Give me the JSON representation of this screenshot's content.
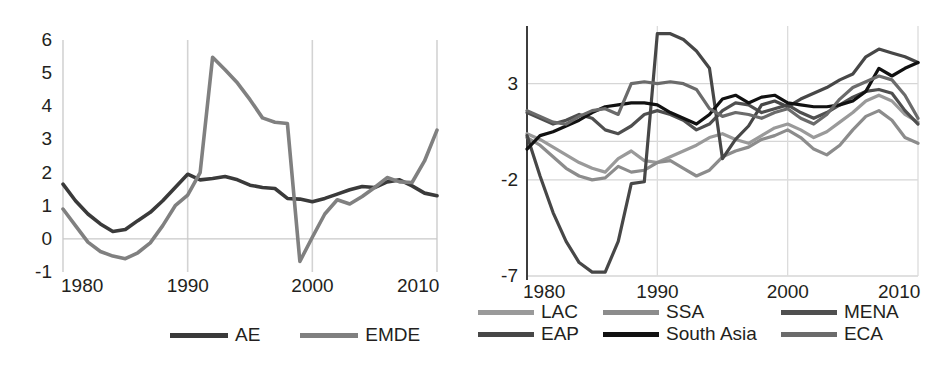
{
  "figure": {
    "background": "#ffffff",
    "text_color": "#231f20"
  },
  "chart_data": [
    {
      "id": "left",
      "type": "line",
      "title": "",
      "xlabel": "",
      "ylabel": "",
      "xlim": [
        1980,
        2010
      ],
      "ylim": [
        -1,
        6
      ],
      "xticks": [
        "1980",
        "1990",
        "2000",
        "2010"
      ],
      "xtick_values": [
        1980,
        1990,
        2000,
        2010
      ],
      "yticks": [
        "6",
        "5",
        "4",
        "3",
        "2",
        "1",
        "0",
        "-1"
      ],
      "ytick_values": [
        6,
        5,
        4,
        3,
        2,
        1,
        0,
        -1
      ],
      "grid": "vertical gridlines at decade ticks; horizontal zero line",
      "legend_position": "bottom-center",
      "x": [
        1980,
        1981,
        1982,
        1983,
        1984,
        1985,
        1986,
        1987,
        1988,
        1989,
        1990,
        1991,
        1992,
        1993,
        1994,
        1995,
        1996,
        1997,
        1998,
        1999,
        2000,
        2001,
        2002,
        2003,
        2004,
        2005,
        2006,
        2007,
        2008,
        2009,
        2010
      ],
      "series": [
        {
          "name": "AE",
          "color": "#3a3a3a",
          "values": [
            1.65,
            1.15,
            0.75,
            0.45,
            0.22,
            0.28,
            0.55,
            0.8,
            1.15,
            1.55,
            1.95,
            1.78,
            1.82,
            1.88,
            1.78,
            1.62,
            1.55,
            1.52,
            1.22,
            1.2,
            1.12,
            1.22,
            1.35,
            1.48,
            1.58,
            1.55,
            1.72,
            1.78,
            1.6,
            1.38,
            1.3
          ]
        },
        {
          "name": "EMDE",
          "color": "#808080",
          "values": [
            0.9,
            0.4,
            -0.1,
            -0.38,
            -0.52,
            -0.6,
            -0.42,
            -0.12,
            0.4,
            1.0,
            1.32,
            2.0,
            5.48,
            5.1,
            4.7,
            4.2,
            3.65,
            3.52,
            3.48,
            -0.68,
            0.05,
            0.75,
            1.18,
            1.05,
            1.28,
            1.55,
            1.85,
            1.72,
            1.7,
            2.35,
            3.28
          ]
        }
      ],
      "series_note": "AE plotted dark grey, EMDE plotted medium grey; EMDE shows a large spike peaking near 5.5 around 1989 and a second rise peaking near 4.6 around 2007, AE stays between 0.2 and 2.0."
    },
    {
      "id": "right",
      "type": "line",
      "title": "",
      "xlabel": "",
      "ylabel": "",
      "xlim": [
        1980,
        2010
      ],
      "ylim": [
        -7,
        6
      ],
      "xticks": [
        "1980",
        "1990",
        "2000",
        "2010"
      ],
      "xtick_values": [
        1980,
        1990,
        2000,
        2010
      ],
      "yticks": [
        "3",
        "-2",
        "-7"
      ],
      "ytick_values": [
        3,
        -2,
        -7
      ],
      "grid": "vertical gridlines at decade ticks; horizontal gridlines at 3, -2, -7 and at 0",
      "legend_position": "bottom, three columns by two rows",
      "x": [
        1980,
        1981,
        1982,
        1983,
        1984,
        1985,
        1986,
        1987,
        1988,
        1989,
        1990,
        1991,
        1992,
        1993,
        1994,
        1995,
        1996,
        1997,
        1998,
        1999,
        2000,
        2001,
        2002,
        2003,
        2004,
        2005,
        2006,
        2007,
        2008,
        2009,
        2010
      ],
      "series": [
        {
          "name": "LAC",
          "color": "#9a9a9a",
          "values": [
            0.4,
            0.1,
            -0.3,
            -0.7,
            -1.1,
            -1.4,
            -1.6,
            -0.9,
            -0.5,
            -1.0,
            -1.1,
            -0.8,
            -0.5,
            -0.2,
            0.2,
            0.4,
            0.1,
            -0.1,
            0.3,
            0.7,
            0.9,
            0.6,
            0.2,
            0.5,
            1.0,
            1.5,
            2.1,
            2.4,
            2.1,
            1.4,
            1.0
          ]
        },
        {
          "name": "SSA",
          "color": "#8c8c8c",
          "values": [
            0.2,
            -0.2,
            -0.8,
            -1.4,
            -1.8,
            -2.0,
            -1.9,
            -1.3,
            -1.6,
            -1.5,
            -1.1,
            -1.0,
            -1.4,
            -1.8,
            -1.5,
            -0.8,
            -0.5,
            -0.3,
            0.1,
            0.3,
            0.6,
            0.2,
            -0.4,
            -0.7,
            -0.2,
            0.6,
            1.3,
            1.6,
            1.1,
            0.2,
            -0.1
          ]
        },
        {
          "name": "MENA",
          "color": "#4f4f4f",
          "values": [
            1.5,
            1.2,
            0.9,
            1.1,
            1.4,
            1.2,
            0.6,
            0.4,
            0.8,
            1.4,
            1.6,
            1.4,
            1.1,
            0.6,
            0.9,
            1.6,
            2.0,
            1.9,
            1.5,
            1.7,
            1.9,
            1.5,
            1.2,
            1.5,
            1.9,
            2.3,
            2.6,
            2.7,
            2.5,
            1.6,
            0.9
          ]
        },
        {
          "name": "EAP",
          "color": "#474747",
          "values": [
            0.3,
            -1.8,
            -3.7,
            -5.2,
            -6.3,
            -6.8,
            -6.8,
            -5.2,
            -2.2,
            -2.1,
            5.6,
            5.6,
            5.3,
            4.7,
            3.8,
            -0.9,
            0.1,
            0.8,
            1.9,
            2.1,
            1.8,
            2.2,
            2.5,
            2.8,
            3.2,
            3.5,
            4.4,
            4.8,
            4.6,
            4.4,
            4.1
          ]
        },
        {
          "name": "South Asia",
          "color": "#111111",
          "values": [
            -0.4,
            0.3,
            0.5,
            0.8,
            1.1,
            1.5,
            1.8,
            1.9,
            2.0,
            2.0,
            1.9,
            1.5,
            1.2,
            0.9,
            1.4,
            2.2,
            2.4,
            2.0,
            2.3,
            2.4,
            2.0,
            1.9,
            1.8,
            1.8,
            1.9,
            2.1,
            2.6,
            3.8,
            3.4,
            3.8,
            4.1
          ]
        },
        {
          "name": "ECA",
          "color": "#6b6b6b",
          "values": [
            1.6,
            1.3,
            1.0,
            0.9,
            1.3,
            1.6,
            1.7,
            1.4,
            3.0,
            3.1,
            3.0,
            3.1,
            3.0,
            2.7,
            1.7,
            1.3,
            1.5,
            1.4,
            1.2,
            1.5,
            1.7,
            1.2,
            0.9,
            1.4,
            2.2,
            2.8,
            3.1,
            3.4,
            3.2,
            2.4,
            1.2
          ]
        }
      ],
      "series_note": "Six regional grey/black lines. EAP falls to about -7 in the mid-1980s then spikes above 5 around 1990-1993; South Asia (black) trends up to about 4 by 2010."
    }
  ],
  "left_chart": {
    "yticks": [
      {
        "label": "6",
        "value": 6
      },
      {
        "label": "5",
        "value": 5
      },
      {
        "label": "4",
        "value": 4
      },
      {
        "label": "3",
        "value": 3
      },
      {
        "label": "2",
        "value": 2
      },
      {
        "label": "1",
        "value": 1
      },
      {
        "label": "0",
        "value": 0
      },
      {
        "label": "-1",
        "value": -1
      }
    ],
    "xticks": [
      {
        "label": "1980",
        "value": 1980
      },
      {
        "label": "1990",
        "value": 1990
      },
      {
        "label": "2000",
        "value": 2000
      },
      {
        "label": "2010",
        "value": 2010
      }
    ],
    "legend": [
      {
        "label": "AE",
        "color": "#3a3a3a"
      },
      {
        "label": "EMDE",
        "color": "#808080"
      }
    ]
  },
  "right_chart": {
    "yticks": [
      {
        "label": "3",
        "value": 3
      },
      {
        "label": "-2",
        "value": -2
      },
      {
        "label": "-7",
        "value": -7
      }
    ],
    "xticks": [
      {
        "label": "1980",
        "value": 1980
      },
      {
        "label": "1990",
        "value": 1990
      },
      {
        "label": "2000",
        "value": 2000
      },
      {
        "label": "2010",
        "value": 2010
      }
    ],
    "legend": [
      {
        "label": "LAC",
        "color": "#9a9a9a"
      },
      {
        "label": "SSA",
        "color": "#8c8c8c"
      },
      {
        "label": "MENA",
        "color": "#4f4f4f"
      },
      {
        "label": "EAP",
        "color": "#474747"
      },
      {
        "label": "South Asia",
        "color": "#111111"
      },
      {
        "label": "ECA",
        "color": "#6b6b6b"
      }
    ]
  }
}
